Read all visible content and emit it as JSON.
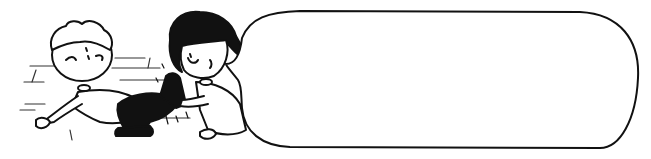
{
  "illustration": {
    "style": "black-and-white line art cartoon",
    "colors": {
      "ink": "#111111",
      "background": "#ffffff"
    },
    "characters": [
      {
        "name": "boy",
        "description": "light-haired boy falling backward, wincing"
      },
      {
        "name": "girl",
        "description": "dark-haired girl holding the boy's black boot"
      }
    ],
    "speech_bubble": {
      "text": ""
    }
  }
}
